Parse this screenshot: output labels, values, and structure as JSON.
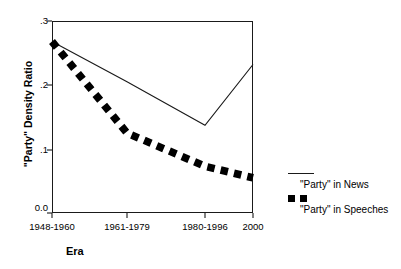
{
  "chart_data": {
    "type": "line",
    "title": "",
    "xlabel": "Era",
    "ylabel": "\"Party\" Density Ratio",
    "categories": [
      "1948-1960",
      "1961-1979",
      "1980-1996",
      "2000"
    ],
    "ylim": [
      0.0,
      0.3
    ],
    "ytick_labels": [
      "0.0",
      ".1",
      ".2",
      ".3"
    ],
    "ytick_values": [
      0.0,
      0.1,
      0.2,
      0.3
    ],
    "grid": false,
    "legend_position": "right",
    "series": [
      {
        "name": "\"Party\" in News",
        "style": "solid",
        "values": [
          0.268,
          0.205,
          0.137,
          0.232
        ]
      },
      {
        "name": "\"Party\" in Speeches",
        "style": "dashed",
        "values": [
          0.268,
          0.125,
          0.073,
          0.055
        ]
      }
    ]
  },
  "axis": {
    "y_title": "\"Party\" Density Ratio",
    "x_title": "Era",
    "y_ticks": [
      {
        "label": ".3",
        "value": 0.3
      },
      {
        "label": ".2",
        "value": 0.2
      },
      {
        "label": ".1",
        "value": 0.1
      },
      {
        "label": "0.0",
        "value": 0.0
      }
    ],
    "x_ticks": [
      {
        "label": "1948-1960"
      },
      {
        "label": "1961-1979"
      },
      {
        "label": "1980-1996"
      },
      {
        "label": "2000"
      }
    ]
  },
  "legend": {
    "items": [
      {
        "label": "\"Party\" in News",
        "marker": "solid-line"
      },
      {
        "label": "\"Party\" in Speeches",
        "marker": "dashed-line"
      }
    ]
  },
  "colors": {
    "ink": "#1a1a1a",
    "marker": "#000000",
    "background": "#ffffff"
  }
}
